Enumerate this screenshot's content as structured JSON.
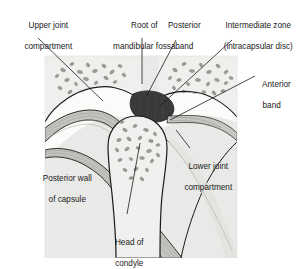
{
  "figure": {
    "type": "anatomical-illustration",
    "background_color": "#ffffff",
    "panel_color": "#e9e9e7",
    "outline_color": "#1a1a1a",
    "fibre_color": "#b9b9b6",
    "bone_speckle_color": "#9a9a97",
    "disc_color": "#3a3a3a",
    "leader_color": "#1a1a1a"
  },
  "labels": {
    "upper_joint_compartment": {
      "line1": "Upper joint",
      "line2": "compartment"
    },
    "root_of_mandibular_fossa": {
      "line1": "Root of",
      "line2": "mandibular fossa"
    },
    "posterior_band": {
      "line1": "Posterior",
      "line2": "band"
    },
    "intermediate_zone": {
      "line1": "Intermediate zone",
      "line2": "(intracapsular disc)"
    },
    "anterior_band": {
      "line1": "Anterior",
      "line2": "band"
    },
    "lower_joint_compartment": {
      "line1": "Lower joint",
      "line2": "compartment"
    },
    "posterior_wall_of_capsule": {
      "line1": "Posterior wall",
      "line2": "of capsule"
    },
    "head_of_condyle": {
      "line1": "Head of",
      "line2": "condyle"
    }
  }
}
